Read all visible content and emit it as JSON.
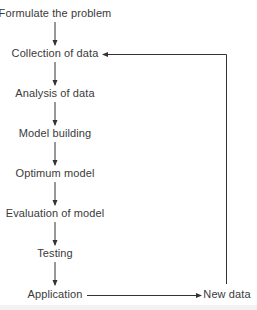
{
  "diagram": {
    "type": "flowchart",
    "nodes": [
      {
        "id": "formulate",
        "label": "Formulate the problem"
      },
      {
        "id": "collection",
        "label": "Collection of data"
      },
      {
        "id": "analysis",
        "label": "Analysis of data"
      },
      {
        "id": "model_building",
        "label": "Model building"
      },
      {
        "id": "optimum_model",
        "label": "Optimum model"
      },
      {
        "id": "evaluation",
        "label": "Evaluation of model"
      },
      {
        "id": "testing",
        "label": "Testing"
      },
      {
        "id": "application",
        "label": "Application"
      },
      {
        "id": "new_data",
        "label": "New data"
      }
    ],
    "edges": [
      {
        "from": "formulate",
        "to": "collection"
      },
      {
        "from": "collection",
        "to": "analysis"
      },
      {
        "from": "analysis",
        "to": "model_building"
      },
      {
        "from": "model_building",
        "to": "optimum_model"
      },
      {
        "from": "optimum_model",
        "to": "evaluation"
      },
      {
        "from": "evaluation",
        "to": "testing"
      },
      {
        "from": "testing",
        "to": "application"
      },
      {
        "from": "application",
        "to": "new_data"
      },
      {
        "from": "new_data",
        "to": "collection",
        "style": "feedback-loop"
      }
    ],
    "colors": {
      "line": "#333333",
      "text": "#3a3a3a",
      "background": "#ffffff"
    }
  }
}
